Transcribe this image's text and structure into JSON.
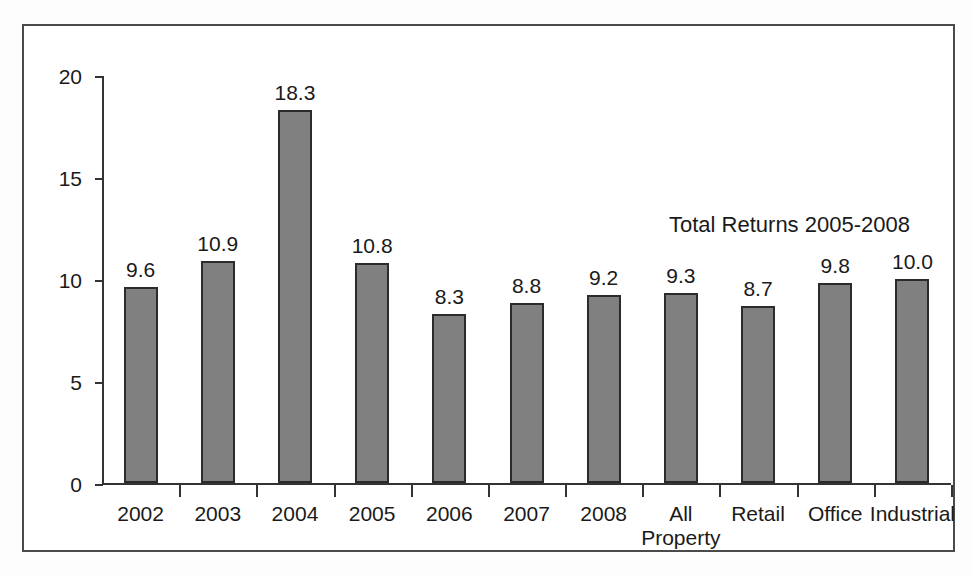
{
  "chart_data": {
    "type": "bar",
    "title": "",
    "annotation": "Total Returns 2005-2008",
    "xlabel": "",
    "ylabel": "",
    "ylim": [
      0,
      20
    ],
    "yticks": [
      0,
      5,
      10,
      15,
      20
    ],
    "ytick_labels": [
      "0",
      "5",
      "10",
      "15",
      "20"
    ],
    "grid": false,
    "legend": "none",
    "categories": [
      "2002",
      "2003",
      "2004",
      "2005",
      "2006",
      "2007",
      "2008",
      "All Property",
      "Retail",
      "Office",
      "Industrial"
    ],
    "category_labels": [
      {
        "line1": "2002",
        "line2": ""
      },
      {
        "line1": "2003",
        "line2": ""
      },
      {
        "line1": "2004",
        "line2": ""
      },
      {
        "line1": "2005",
        "line2": ""
      },
      {
        "line1": "2006",
        "line2": ""
      },
      {
        "line1": "2007",
        "line2": ""
      },
      {
        "line1": "2008",
        "line2": ""
      },
      {
        "line1": "All",
        "line2": "Property"
      },
      {
        "line1": "Retail",
        "line2": ""
      },
      {
        "line1": "Office",
        "line2": ""
      },
      {
        "line1": "Industrial",
        "line2": ""
      }
    ],
    "values": [
      9.6,
      10.9,
      18.3,
      10.8,
      8.3,
      8.8,
      9.2,
      9.3,
      8.7,
      9.8,
      10.0
    ],
    "value_labels": [
      "9.6",
      "10.9",
      "18.3",
      "10.8",
      "8.3",
      "8.8",
      "9.2",
      "9.3",
      "8.7",
      "9.8",
      "10.0"
    ],
    "colors": {
      "bar_fill": "#808080",
      "bar_border": "#2b2b2b",
      "axis": "#333333",
      "text": "#1a1a1a",
      "frame": "#4a4a4a",
      "background": "#ffffff"
    }
  }
}
